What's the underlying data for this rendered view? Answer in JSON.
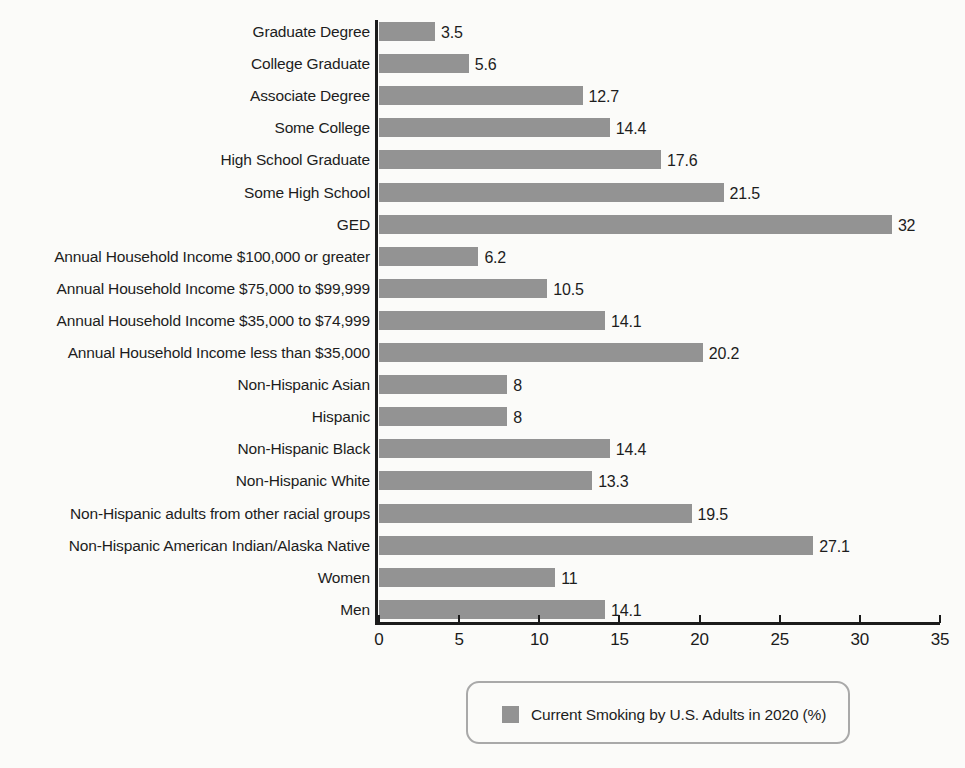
{
  "chart_data": {
    "type": "bar",
    "orientation": "horizontal",
    "title": "",
    "xlabel": "",
    "ylabel": "",
    "xlim": [
      0,
      35
    ],
    "xticks": [
      0,
      5,
      10,
      15,
      20,
      25,
      30,
      35
    ],
    "grid": false,
    "legend": {
      "position": "bottom-center",
      "entries": [
        {
          "label": "Current Smoking by U.S. Adults in 2020 (%)",
          "color": "#939393"
        }
      ]
    },
    "series": [
      {
        "name": "Current Smoking by U.S. Adults in 2020 (%)",
        "color": "#939393",
        "values": [
          3.5,
          5.6,
          12.7,
          14.4,
          17.6,
          21.5,
          32,
          6.2,
          10.5,
          14.1,
          20.2,
          8,
          8,
          14.4,
          13.3,
          19.5,
          27.1,
          11,
          14.1
        ]
      }
    ],
    "categories": [
      "Graduate Degree",
      "College Graduate",
      "Associate Degree",
      "Some College",
      "High School Graduate",
      "Some High School",
      "GED",
      "Annual Household Income $100,000 or greater",
      "Annual Household Income $75,000 to $99,999",
      "Annual Household Income $35,000 to $74,999",
      "Annual Household Income less than $35,000",
      "Non-Hispanic Asian",
      "Hispanic",
      "Non-Hispanic Black",
      "Non-Hispanic White",
      "Non-Hispanic adults from other racial groups",
      "Non-Hispanic American Indian/Alaska Native",
      "Women",
      "Men"
    ],
    "data_labels": [
      "3.5",
      "5.6",
      "12.7",
      "14.4",
      "17.6",
      "21.5",
      "32",
      "6.2",
      "10.5",
      "14.1",
      "20.2",
      "8",
      "8",
      "14.4",
      "13.3",
      "19.5",
      "27.1",
      "11",
      "14.1"
    ],
    "tick_labels": [
      "0",
      "5",
      "10",
      "15",
      "20",
      "25",
      "30",
      "35"
    ]
  },
  "colors": {
    "bar": "#939393",
    "axis": "#1b1b1b",
    "text": "#1d1d1d",
    "background": "#fbfbf9",
    "legend_border": "#a9a9a9"
  }
}
